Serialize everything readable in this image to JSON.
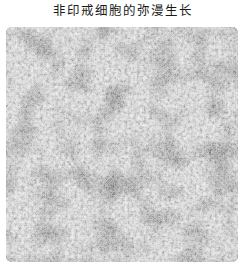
{
  "figure": {
    "title": "非印戒细胞的弥漫生长",
    "image": {
      "type": "histology-micrograph",
      "description": "Grayscale microscopic image showing diffuse growth of densely packed non-signet-ring cells",
      "color_mode": "grayscale",
      "colors": {
        "background_mid": "#9a9a9a",
        "nuclei_dark": "#2a2a2a",
        "stroma_light": "#e6e6e6"
      }
    }
  }
}
